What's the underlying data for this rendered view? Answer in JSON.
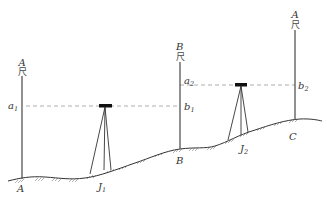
{
  "diagram": {
    "type": "leveling-survey",
    "colors": {
      "line": "#333333",
      "dashed": "#999999",
      "instrument": "#111111",
      "background": "#ffffff"
    },
    "staffs": [
      {
        "id": "staff-A",
        "top_label": "A",
        "staff_char": "尺",
        "reading_labels": [
          {
            "text": "a",
            "sub": "1"
          }
        ],
        "ground_label": "A"
      },
      {
        "id": "staff-B",
        "top_label": "B",
        "staff_char": "尺",
        "reading_labels": [
          {
            "text": "a",
            "sub": "2"
          },
          {
            "text": "b",
            "sub": "1"
          }
        ],
        "ground_label": "B"
      },
      {
        "id": "staff-C",
        "top_label": "A",
        "staff_char": "尺",
        "reading_labels": [
          {
            "text": "b",
            "sub": "2"
          }
        ],
        "ground_label": "C"
      }
    ],
    "instruments": [
      {
        "id": "level-J1",
        "label": "J",
        "sub": "1"
      },
      {
        "id": "level-J2",
        "label": "J",
        "sub": "2"
      }
    ]
  }
}
